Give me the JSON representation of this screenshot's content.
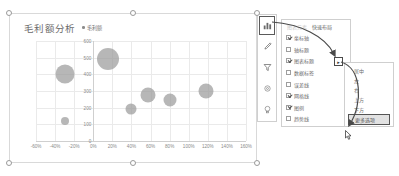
{
  "chart": {
    "title": "毛利额分析",
    "legend": "毛利额",
    "selected": true
  },
  "chart_data": {
    "type": "scatter",
    "title": "毛利额分析",
    "xlabel": "",
    "ylabel": "",
    "legend": [
      "毛利额"
    ],
    "legend_position": "top",
    "grid": true,
    "xlim": [
      -60,
      160
    ],
    "ylim": [
      0,
      600
    ],
    "xticks": [
      "-60%",
      "-40%",
      "-20%",
      "0%",
      "20%",
      "40%",
      "60%",
      "80%",
      "100%",
      "120%",
      "140%",
      "160%"
    ],
    "xtick_values": [
      -60,
      -40,
      -20,
      0,
      20,
      40,
      60,
      80,
      100,
      120,
      140,
      160
    ],
    "yticks": [
      "0",
      "100",
      "200",
      "300",
      "400",
      "500",
      "600"
    ],
    "ytick_values": [
      0,
      100,
      200,
      300,
      400,
      500,
      600
    ],
    "series": [
      {
        "name": "毛利额",
        "points": [
          {
            "x": -30,
            "y": 400,
            "size": 19
          },
          {
            "x": -30,
            "y": 120,
            "size": 8
          },
          {
            "x": 15,
            "y": 490,
            "size": 22
          },
          {
            "x": 40,
            "y": 195,
            "size": 11
          },
          {
            "x": 57,
            "y": 275,
            "size": 15
          },
          {
            "x": 80,
            "y": 245,
            "size": 13
          },
          {
            "x": 118,
            "y": 300,
            "size": 15
          }
        ]
      }
    ]
  },
  "icon_strip": {
    "items": [
      {
        "name": "chart-elements-icon",
        "glyph": "chart",
        "selected": true
      },
      {
        "name": "chart-styles-icon",
        "glyph": "brush",
        "selected": false
      },
      {
        "name": "chart-filters-icon",
        "glyph": "funnel",
        "selected": false
      },
      {
        "name": "format-icon",
        "glyph": "gear",
        "selected": false
      },
      {
        "name": "ideas-icon",
        "glyph": "bulb",
        "selected": false
      }
    ]
  },
  "elements_panel": {
    "tabs": [
      {
        "label": "图表元素",
        "active": false
      },
      {
        "label": "快速布局",
        "active": true
      }
    ],
    "items": [
      {
        "label": "坐标轴",
        "checked": true
      },
      {
        "label": "轴标题",
        "checked": false
      },
      {
        "label": "图表标题",
        "checked": true
      },
      {
        "label": "数据标签",
        "checked": false
      },
      {
        "label": "误差线",
        "checked": false
      },
      {
        "label": "网格线",
        "checked": true
      },
      {
        "label": "图例",
        "checked": true
      },
      {
        "label": "趋势线",
        "checked": false
      }
    ],
    "flyout_glyph": "▸"
  },
  "submenu": {
    "items": [
      {
        "label": "居中",
        "highlight": false
      },
      {
        "label": "左",
        "highlight": false
      },
      {
        "label": "右",
        "highlight": false
      },
      {
        "label": "上方",
        "highlight": false
      },
      {
        "label": "下方",
        "highlight": false
      },
      {
        "label": "更多选项",
        "highlight": true
      }
    ]
  },
  "colors": {
    "bubble": "#9b9b9b",
    "grid": "#eaeaea",
    "panel_border": "#cfcfcf",
    "highlight_bg": "#e2e2e2",
    "text": "#6d6d6d"
  }
}
